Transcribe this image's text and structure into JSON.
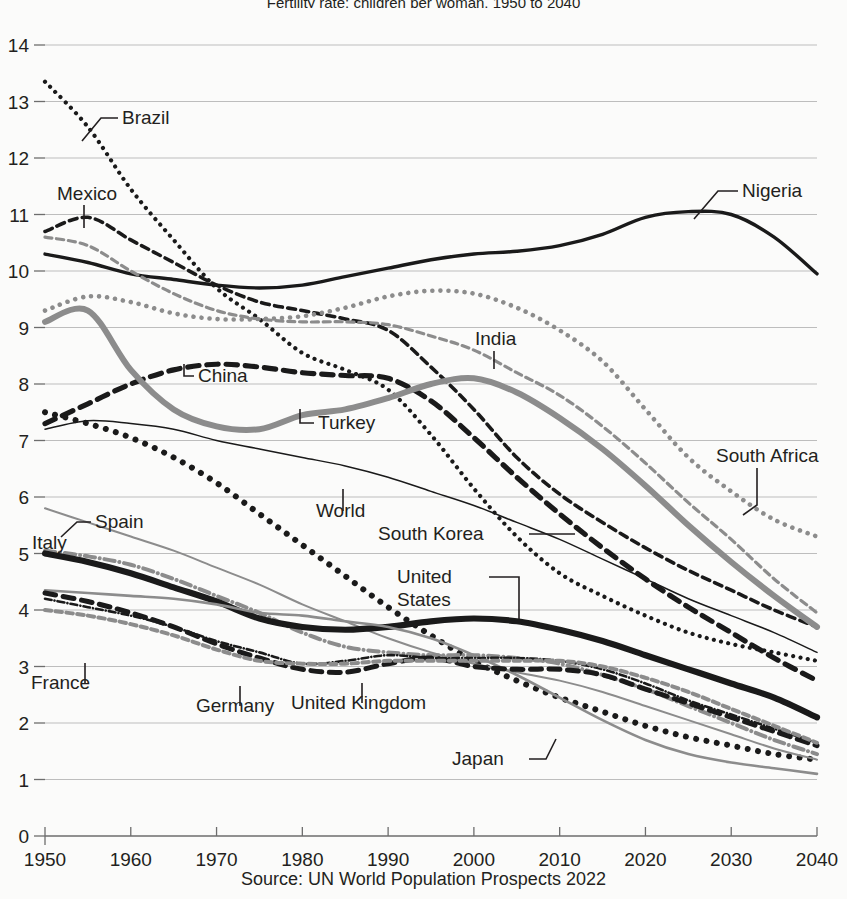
{
  "title": "Fertility rate: children per woman, 1950 to 2040",
  "source": "Source: UN World Population Prospects 2022",
  "axis": {
    "y_ticks": [
      "0",
      "1",
      "2",
      "3",
      "4",
      "5",
      "6",
      "7",
      "8",
      "9",
      "10",
      "11",
      "12",
      "13",
      "14"
    ],
    "x_ticks": [
      "1950",
      "1960",
      "1970",
      "1980",
      "1990",
      "2000",
      "2010",
      "2020",
      "2030",
      "2040"
    ]
  },
  "labels": {
    "brazil": "Brazil",
    "mexico": "Mexico",
    "nigeria": "Nigeria",
    "india": "India",
    "china": "China",
    "turkey": "Turkey",
    "south_africa": "South Africa",
    "world": "World",
    "spain": "Spain",
    "italy": "Italy",
    "south_korea": "South Korea",
    "united_states_1": "United",
    "united_states_2": "States",
    "france": "France",
    "germany": "Germany",
    "united_kingdom": "United Kingdom",
    "japan": "Japan"
  },
  "chart_data": {
    "type": "line",
    "title": "Fertility rate: children per woman, 1950 to 2040",
    "xlabel": "",
    "ylabel": "",
    "xlim": [
      1950,
      2040
    ],
    "ylim": [
      0,
      14
    ],
    "grid": true,
    "legend": "inline-labels",
    "x": [
      1950,
      1955,
      1960,
      1965,
      1970,
      1975,
      1980,
      1985,
      1990,
      1995,
      2000,
      2005,
      2010,
      2015,
      2020,
      2025,
      2030,
      2035,
      2040
    ],
    "series": [
      {
        "name": "Brazil",
        "color": "#1a1a1a",
        "style": "dotted",
        "width": 4.2,
        "values": [
          13.35,
          12.55,
          11.45,
          10.55,
          9.7,
          9.15,
          8.55,
          8.25,
          7.9,
          7.1,
          6.15,
          5.3,
          4.65,
          4.25,
          3.9,
          3.6,
          3.4,
          3.25,
          3.1
        ]
      },
      {
        "name": "Mexico",
        "color": "#1a1a1a",
        "style": "dashed",
        "width": 3.6,
        "values": [
          10.7,
          10.95,
          10.55,
          10.15,
          9.75,
          9.45,
          9.3,
          9.15,
          8.95,
          8.3,
          7.55,
          6.7,
          6.05,
          5.55,
          5.1,
          4.7,
          4.35,
          4.0,
          3.7
        ]
      },
      {
        "name": "Nigeria",
        "color": "#1a1a1a",
        "style": "solid",
        "width": 3.4,
        "values": [
          10.3,
          10.15,
          9.95,
          9.85,
          9.75,
          9.7,
          9.75,
          9.9,
          10.05,
          10.2,
          10.3,
          10.35,
          10.45,
          10.65,
          10.95,
          11.05,
          11.0,
          10.6,
          9.95
        ]
      },
      {
        "name": "India",
        "color": "#8c8c8c",
        "style": "dashed",
        "width": 3.2,
        "values": [
          10.6,
          10.45,
          10.0,
          9.6,
          9.3,
          9.15,
          9.1,
          9.1,
          9.05,
          8.85,
          8.6,
          8.2,
          7.8,
          7.25,
          6.6,
          5.9,
          5.25,
          4.55,
          3.95
        ]
      },
      {
        "name": "South Africa",
        "color": "#8c8c8c",
        "style": "dotted",
        "width": 4.6,
        "values": [
          9.3,
          9.55,
          9.45,
          9.25,
          9.15,
          9.15,
          9.2,
          9.35,
          9.55,
          9.65,
          9.6,
          9.35,
          8.95,
          8.4,
          7.55,
          6.7,
          6.1,
          5.6,
          5.3
        ]
      },
      {
        "name": "China",
        "color": "#1a1a1a",
        "style": "dashed",
        "width": 5.2,
        "values": [
          7.3,
          7.65,
          8.0,
          8.25,
          8.35,
          8.3,
          8.2,
          8.15,
          8.1,
          7.7,
          7.05,
          6.35,
          5.7,
          5.1,
          4.55,
          4.05,
          3.6,
          3.15,
          2.75
        ]
      },
      {
        "name": "Turkey",
        "color": "#8c8c8c",
        "style": "solid",
        "width": 6.0,
        "values": [
          9.1,
          9.3,
          8.25,
          7.55,
          7.25,
          7.2,
          7.45,
          7.55,
          7.75,
          8.0,
          8.1,
          7.85,
          7.4,
          6.85,
          6.2,
          5.5,
          4.85,
          4.25,
          3.7
        ]
      },
      {
        "name": "World",
        "color": "#1a1a1a",
        "style": "solid",
        "width": 1.5,
        "values": [
          7.2,
          7.35,
          7.3,
          7.2,
          7.0,
          6.85,
          6.7,
          6.55,
          6.35,
          6.1,
          5.85,
          5.55,
          5.25,
          4.9,
          4.55,
          4.2,
          3.9,
          3.6,
          3.25
        ]
      },
      {
        "name": "Japan",
        "color": "#1a1a1a",
        "style": "dotted",
        "width": 6.0,
        "values": [
          7.5,
          7.3,
          7.05,
          6.7,
          6.25,
          5.7,
          5.15,
          4.6,
          4.05,
          3.55,
          3.1,
          2.75,
          2.45,
          2.2,
          1.95,
          1.75,
          1.6,
          1.45,
          1.35
        ]
      },
      {
        "name": "Spain",
        "color": "#8c8c8c",
        "style": "solid",
        "width": 2.0,
        "values": [
          5.8,
          5.55,
          5.3,
          5.05,
          4.75,
          4.45,
          4.1,
          3.8,
          3.5,
          3.25,
          3.05,
          2.9,
          2.75,
          2.55,
          2.3,
          2.05,
          1.8,
          1.55,
          1.35
        ]
      },
      {
        "name": "Italy",
        "color": "#8c8c8c",
        "style": "dashdot",
        "width": 4.0,
        "values": [
          5.05,
          4.95,
          4.8,
          4.55,
          4.25,
          3.95,
          3.6,
          3.35,
          3.25,
          3.2,
          3.2,
          3.15,
          3.05,
          2.85,
          2.6,
          2.3,
          2.0,
          1.7,
          1.45
        ]
      },
      {
        "name": "United States",
        "color": "#1a1a1a",
        "style": "solid",
        "width": 6.2,
        "values": [
          5.0,
          4.85,
          4.65,
          4.4,
          4.15,
          3.85,
          3.7,
          3.65,
          3.7,
          3.8,
          3.85,
          3.8,
          3.65,
          3.45,
          3.2,
          2.95,
          2.7,
          2.45,
          2.1
        ]
      },
      {
        "name": "South Korea",
        "color": "#8c8c8c",
        "style": "solid",
        "width": 2.6,
        "values": [
          4.35,
          4.3,
          4.25,
          4.2,
          4.1,
          3.95,
          3.9,
          3.8,
          3.7,
          3.5,
          3.2,
          2.85,
          2.45,
          2.05,
          1.7,
          1.45,
          1.3,
          1.2,
          1.1
        ]
      },
      {
        "name": "France",
        "color": "#1a1a1a",
        "style": "dashdot",
        "width": 2.6,
        "values": [
          4.2,
          4.05,
          3.9,
          3.7,
          3.45,
          3.25,
          3.05,
          3.1,
          3.2,
          3.15,
          3.15,
          3.15,
          3.1,
          2.95,
          2.7,
          2.4,
          2.15,
          1.9,
          1.65
        ]
      },
      {
        "name": "Germany",
        "color": "#1a1a1a",
        "style": "dashed",
        "width": 5.0,
        "values": [
          4.3,
          4.15,
          3.95,
          3.7,
          3.4,
          3.15,
          2.95,
          2.9,
          3.05,
          3.15,
          3.0,
          2.95,
          2.95,
          2.85,
          2.6,
          2.35,
          2.1,
          1.85,
          1.6
        ]
      },
      {
        "name": "United Kingdom",
        "color": "#8c8c8c",
        "style": "dashed-light",
        "width": 4.0,
        "values": [
          4.0,
          3.9,
          3.75,
          3.55,
          3.3,
          3.1,
          3.05,
          3.05,
          3.1,
          3.1,
          3.1,
          3.1,
          3.1,
          3.0,
          2.8,
          2.55,
          2.25,
          1.95,
          1.65
        ]
      }
    ]
  }
}
